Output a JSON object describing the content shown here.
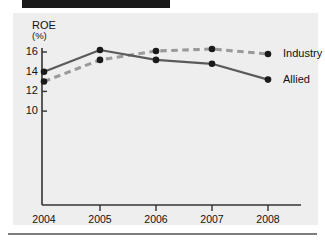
{
  "figure": {
    "background_color": "#ffffff",
    "panel_color": "#eeeeee",
    "top_bar_color": "#1a1a1a",
    "rule_color": "#7d7d7d"
  },
  "chart_data": {
    "type": "line",
    "title": "",
    "subtitle": "",
    "xlabel": "",
    "ylabel": "ROE",
    "ylabel_unit": "(%)",
    "categories": [
      "2004",
      "2005",
      "2006",
      "2007",
      "2008"
    ],
    "x": [
      2004,
      2005,
      2006,
      2007,
      2008
    ],
    "ylim": [
      9.0,
      16.9
    ],
    "xlim": [
      2003.85,
      2008.55
    ],
    "yticks": [
      16,
      14,
      12,
      10
    ],
    "ytick_labels": [
      "16",
      "14",
      "12",
      "10"
    ],
    "xtick_labels": [
      "2004",
      "2005",
      "2006",
      "2007",
      "2008"
    ],
    "grid": false,
    "legend_position": "right-of-lines",
    "series": [
      {
        "name": "Industry",
        "values": [
          13.0,
          15.2,
          16.1,
          16.3,
          15.8
        ],
        "color": "#9a9a9a",
        "style": "dashed",
        "marker": "circle",
        "marker_color": "#1a1a1a"
      },
      {
        "name": "Allied",
        "values": [
          14.0,
          16.2,
          15.2,
          14.8,
          13.2
        ],
        "color": "#5a5a5a",
        "style": "solid",
        "marker": "circle",
        "marker_color": "#1a1a1a"
      }
    ]
  },
  "legend": {
    "items": [
      {
        "label": "Industry"
      },
      {
        "label": "Allied"
      }
    ]
  },
  "axis": {
    "line_color": "#333333",
    "y_ticks": [
      {
        "label": "16"
      },
      {
        "label": "14"
      },
      {
        "label": "12"
      },
      {
        "label": "10"
      }
    ],
    "x_ticks": [
      {
        "label": "2004"
      },
      {
        "label": "2005"
      },
      {
        "label": "2006"
      },
      {
        "label": "2007"
      },
      {
        "label": "2008"
      }
    ]
  }
}
